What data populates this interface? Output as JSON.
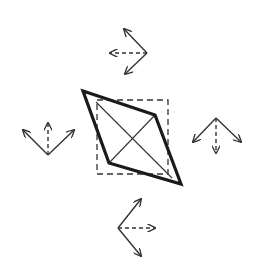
{
  "diagram": {
    "colors": {
      "background": "#ffffff",
      "stroke": "#1a1a1a",
      "thin_stroke": "#333333"
    },
    "rhombus": {
      "points": [
        [
          83,
          91
        ],
        [
          155,
          115
        ],
        [
          181,
          184
        ],
        [
          109,
          163
        ]
      ]
    },
    "dashed_square": {
      "x": 97,
      "y": 100,
      "width": 71,
      "height": 74
    },
    "diagonals": [
      {
        "x1": 96,
        "y1": 102,
        "x2": 172,
        "y2": 178
      },
      {
        "x1": 109,
        "y1": 163,
        "x2": 155,
        "y2": 115
      }
    ],
    "arrow_glyphs": [
      {
        "name": "top",
        "origin": [
          147,
          53
        ],
        "solid": [
          [
            124,
            29
          ],
          [
            125,
            74
          ]
        ],
        "dashed": [
          110,
          53
        ]
      },
      {
        "name": "left",
        "origin": [
          48,
          155
        ],
        "solid": [
          [
            23,
            130
          ],
          [
            74,
            130
          ]
        ],
        "dashed": [
          48,
          123
        ]
      },
      {
        "name": "right",
        "origin": [
          216,
          118
        ],
        "solid": [
          [
            193,
            142
          ],
          [
            241,
            142
          ]
        ],
        "dashed": [
          216,
          153
        ]
      },
      {
        "name": "bottom",
        "origin": [
          118,
          228
        ],
        "solid": [
          [
            141,
            199
          ],
          [
            141,
            256
          ]
        ],
        "dashed": [
          155,
          228
        ]
      }
    ]
  }
}
